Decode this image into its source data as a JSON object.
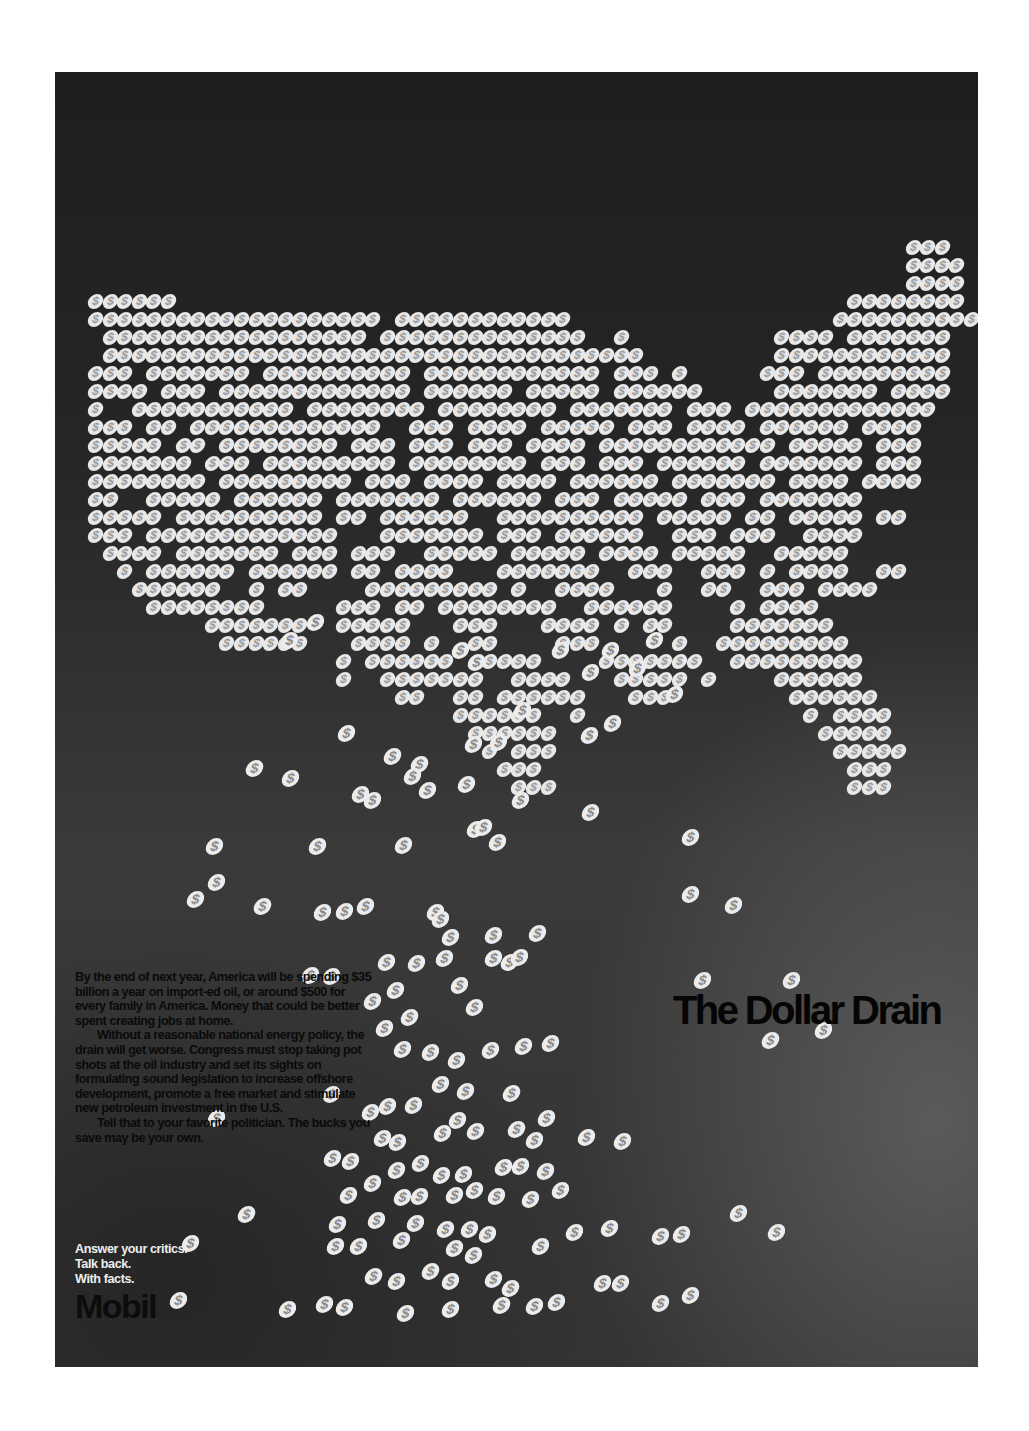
{
  "colors": {
    "page_bg": "#ffffff",
    "panel_bg": "#262626",
    "coin": "#e8e8e8",
    "body_text": "#0a0a0a",
    "tagline_text": "#eeeeee"
  },
  "coin_glyph": "$",
  "headline": "The Dollar Drain",
  "body_copy": {
    "paragraphs": [
      "By the end of next year, America will be spending $35 billion a year on import-ed oil, or around $500 for every family in America. Money that could be better spent creating jobs at home.",
      "Without a reasonable national energy policy, the drain will get worse. Congress must stop taking pot shots at the oil industry and set its sights on formulating sound legislation to increase offshore development, promote a free market and stimulate new petroleum investment in the U.S.",
      "Tell that to your favorite politician. The bucks you save may be your own."
    ]
  },
  "tagline": {
    "lines": [
      "Answer your critics.",
      "Talk back.",
      "With facts."
    ]
  },
  "logo": "Mobil",
  "map_grid": {
    "origin_x": 40,
    "origin_y": 175,
    "col_pitch": 14.6,
    "row_pitch": 18,
    "rows": [
      [
        [
          56,
          3
        ]
      ],
      [
        [
          56,
          4
        ]
      ],
      [
        [
          56,
          4
        ]
      ],
      [
        [
          0,
          6
        ],
        [
          52,
          8
        ]
      ],
      [
        [
          0,
          20
        ],
        [
          21,
          12
        ],
        [
          51,
          10
        ]
      ],
      [
        [
          1,
          18
        ],
        [
          20,
          14
        ],
        [
          36,
          1
        ],
        [
          47,
          4
        ],
        [
          52,
          4
        ],
        [
          53,
          6
        ]
      ],
      [
        [
          1,
          33
        ],
        [
          34,
          4
        ],
        [
          47,
          12
        ]
      ],
      [
        [
          0,
          3
        ],
        [
          4,
          7
        ],
        [
          12,
          10
        ],
        [
          23,
          12
        ],
        [
          36,
          3
        ],
        [
          40,
          1
        ],
        [
          46,
          3
        ],
        [
          50,
          9
        ]
      ],
      [
        [
          0,
          4
        ],
        [
          5,
          3
        ],
        [
          9,
          13
        ],
        [
          23,
          6
        ],
        [
          30,
          5
        ],
        [
          36,
          6
        ],
        [
          47,
          7
        ],
        [
          55,
          4
        ]
      ],
      [
        [
          0,
          1
        ],
        [
          3,
          11
        ],
        [
          15,
          8
        ],
        [
          24,
          8
        ],
        [
          33,
          7
        ],
        [
          41,
          3
        ],
        [
          45,
          13
        ]
      ],
      [
        [
          0,
          3
        ],
        [
          4,
          2
        ],
        [
          7,
          13
        ],
        [
          22,
          3
        ],
        [
          26,
          4
        ],
        [
          31,
          5
        ],
        [
          37,
          3
        ],
        [
          41,
          4
        ],
        [
          46,
          6
        ],
        [
          53,
          4
        ]
      ],
      [
        [
          0,
          5
        ],
        [
          6,
          2
        ],
        [
          9,
          8
        ],
        [
          18,
          3
        ],
        [
          22,
          3
        ],
        [
          26,
          3
        ],
        [
          30,
          4
        ],
        [
          35,
          12
        ],
        [
          48,
          5
        ],
        [
          54,
          3
        ]
      ],
      [
        [
          0,
          7
        ],
        [
          8,
          3
        ],
        [
          12,
          9
        ],
        [
          22,
          8
        ],
        [
          31,
          3
        ],
        [
          35,
          3
        ],
        [
          39,
          6
        ],
        [
          46,
          7
        ],
        [
          54,
          3
        ]
      ],
      [
        [
          0,
          8
        ],
        [
          9,
          9
        ],
        [
          19,
          3
        ],
        [
          23,
          4
        ],
        [
          28,
          4
        ],
        [
          33,
          6
        ],
        [
          40,
          7
        ],
        [
          48,
          4
        ],
        [
          53,
          4
        ]
      ],
      [
        [
          0,
          2
        ],
        [
          4,
          5
        ],
        [
          10,
          6
        ],
        [
          17,
          7
        ],
        [
          25,
          6
        ],
        [
          32,
          3
        ],
        [
          36,
          5
        ],
        [
          42,
          3
        ],
        [
          46,
          7
        ]
      ],
      [
        [
          0,
          5
        ],
        [
          6,
          10
        ],
        [
          17,
          2
        ],
        [
          20,
          6
        ],
        [
          28,
          10
        ],
        [
          39,
          5
        ],
        [
          45,
          2
        ],
        [
          48,
          5
        ],
        [
          54,
          2
        ]
      ],
      [
        [
          0,
          3
        ],
        [
          4,
          13
        ],
        [
          20,
          7
        ],
        [
          28,
          3
        ],
        [
          32,
          6
        ],
        [
          40,
          3
        ],
        [
          44,
          3
        ],
        [
          49,
          4
        ]
      ],
      [
        [
          1,
          4
        ],
        [
          6,
          7
        ],
        [
          14,
          3
        ],
        [
          18,
          3
        ],
        [
          23,
          5
        ],
        [
          29,
          5
        ],
        [
          35,
          4
        ],
        [
          40,
          5
        ],
        [
          47,
          5
        ]
      ],
      [
        [
          2,
          1
        ],
        [
          4,
          6
        ],
        [
          11,
          6
        ],
        [
          18,
          2
        ],
        [
          21,
          4
        ],
        [
          28,
          7
        ],
        [
          37,
          3
        ],
        [
          42,
          3
        ],
        [
          46,
          1
        ],
        [
          48,
          4
        ],
        [
          54,
          2
        ]
      ],
      [
        [
          3,
          6
        ],
        [
          11,
          1
        ],
        [
          13,
          2
        ],
        [
          19,
          9
        ],
        [
          29,
          1
        ],
        [
          32,
          4
        ],
        [
          39,
          1
        ],
        [
          42,
          2
        ],
        [
          46,
          3
        ],
        [
          50,
          4
        ]
      ],
      [
        [
          4,
          7
        ],
        [
          11,
          1
        ],
        [
          17,
          3
        ],
        [
          21,
          2
        ],
        [
          24,
          8
        ],
        [
          34,
          6
        ],
        [
          44,
          1
        ],
        [
          46,
          4
        ]
      ],
      [
        [
          8,
          7
        ],
        [
          17,
          5
        ],
        [
          25,
          3
        ],
        [
          31,
          4
        ],
        [
          36,
          1
        ],
        [
          38,
          2
        ],
        [
          44,
          7
        ]
      ],
      [
        [
          9,
          6
        ],
        [
          18,
          4
        ],
        [
          23,
          1
        ],
        [
          26,
          2
        ],
        [
          32,
          3
        ],
        [
          40,
          1
        ],
        [
          43,
          9
        ]
      ],
      [
        [
          17,
          1
        ],
        [
          19,
          6
        ],
        [
          27,
          4
        ],
        [
          35,
          7
        ],
        [
          44,
          9
        ]
      ],
      [
        [
          17,
          1
        ],
        [
          20,
          7
        ],
        [
          29,
          4
        ],
        [
          36,
          5
        ],
        [
          42,
          1
        ],
        [
          47,
          6
        ]
      ],
      [
        [
          21,
          2
        ],
        [
          25,
          2
        ],
        [
          28,
          6
        ],
        [
          37,
          3
        ],
        [
          48,
          6
        ]
      ],
      [
        [
          25,
          6
        ],
        [
          33,
          1
        ],
        [
          49,
          1
        ],
        [
          51,
          4
        ]
      ],
      [
        [
          26,
          6
        ],
        [
          50,
          5
        ]
      ],
      [
        [
          27,
          1
        ],
        [
          29,
          3
        ],
        [
          51,
          5
        ]
      ],
      [
        [
          28,
          3
        ],
        [
          52,
          3
        ]
      ],
      [
        [
          29,
          3
        ],
        [
          52,
          3
        ]
      ]
    ]
  },
  "falling_coins": [
    [
      289,
      640
    ],
    [
      315,
      622
    ],
    [
      460,
      650
    ],
    [
      476,
      662
    ],
    [
      560,
      650
    ],
    [
      590,
      672
    ],
    [
      610,
      650
    ],
    [
      637,
      668
    ],
    [
      654,
      640
    ],
    [
      346,
      733
    ],
    [
      392,
      756
    ],
    [
      419,
      764
    ],
    [
      473,
      744
    ],
    [
      498,
      742
    ],
    [
      522,
      710
    ],
    [
      589,
      735
    ],
    [
      612,
      723
    ],
    [
      674,
      694
    ],
    [
      254,
      768
    ],
    [
      290,
      778
    ],
    [
      360,
      794
    ],
    [
      372,
      800
    ],
    [
      412,
      776
    ],
    [
      427,
      790
    ],
    [
      466,
      784
    ],
    [
      520,
      800
    ],
    [
      214,
      846
    ],
    [
      317,
      846
    ],
    [
      403,
      845
    ],
    [
      475,
      829
    ],
    [
      483,
      827
    ],
    [
      497,
      842
    ],
    [
      590,
      812
    ],
    [
      690,
      837
    ],
    [
      195,
      899
    ],
    [
      262,
      906
    ],
    [
      322,
      912
    ],
    [
      344,
      911
    ],
    [
      365,
      906
    ],
    [
      435,
      912
    ],
    [
      450,
      937
    ],
    [
      493,
      935
    ],
    [
      537,
      933
    ],
    [
      440,
      919
    ],
    [
      386,
      962
    ],
    [
      416,
      963
    ],
    [
      444,
      958
    ],
    [
      493,
      958
    ],
    [
      509,
      962
    ],
    [
      519,
      957
    ],
    [
      690,
      894
    ],
    [
      733,
      905
    ],
    [
      310,
      975
    ],
    [
      331,
      976
    ],
    [
      372,
      1001
    ],
    [
      395,
      990
    ],
    [
      409,
      1017
    ],
    [
      459,
      985
    ],
    [
      474,
      1007
    ],
    [
      384,
      1028
    ],
    [
      402,
      1049
    ],
    [
      430,
      1052
    ],
    [
      456,
      1060
    ],
    [
      490,
      1050
    ],
    [
      523,
      1046
    ],
    [
      550,
      1043
    ],
    [
      216,
      1118
    ],
    [
      331,
      1094
    ],
    [
      370,
      1112
    ],
    [
      387,
      1106
    ],
    [
      413,
      1105
    ],
    [
      440,
      1084
    ],
    [
      465,
      1091
    ],
    [
      511,
      1093
    ],
    [
      546,
      1118
    ],
    [
      382,
      1138
    ],
    [
      397,
      1142
    ],
    [
      442,
      1133
    ],
    [
      457,
      1120
    ],
    [
      475,
      1131
    ],
    [
      516,
      1129
    ],
    [
      534,
      1140
    ],
    [
      586,
      1137
    ],
    [
      622,
      1141
    ],
    [
      332,
      1158
    ],
    [
      350,
      1161
    ],
    [
      396,
      1170
    ],
    [
      420,
      1163
    ],
    [
      441,
      1175
    ],
    [
      463,
      1174
    ],
    [
      503,
      1167
    ],
    [
      520,
      1166
    ],
    [
      545,
      1171
    ],
    [
      348,
      1195
    ],
    [
      372,
      1183
    ],
    [
      402,
      1197
    ],
    [
      419,
      1196
    ],
    [
      454,
      1195
    ],
    [
      474,
      1190
    ],
    [
      496,
      1196
    ],
    [
      530,
      1199
    ],
    [
      560,
      1190
    ],
    [
      246,
      1214
    ],
    [
      337,
      1224
    ],
    [
      376,
      1220
    ],
    [
      415,
      1223
    ],
    [
      445,
      1229
    ],
    [
      469,
      1229
    ],
    [
      487,
      1234
    ],
    [
      574,
      1232
    ],
    [
      609,
      1228
    ],
    [
      738,
      1213
    ],
    [
      776,
      1232
    ],
    [
      190,
      1243
    ],
    [
      335,
      1246
    ],
    [
      358,
      1246
    ],
    [
      401,
      1240
    ],
    [
      454,
      1248
    ],
    [
      473,
      1255
    ],
    [
      540,
      1246
    ],
    [
      660,
      1236
    ],
    [
      681,
      1234
    ],
    [
      373,
      1276
    ],
    [
      396,
      1281
    ],
    [
      430,
      1271
    ],
    [
      450,
      1281
    ],
    [
      493,
      1279
    ],
    [
      510,
      1288
    ],
    [
      602,
      1283
    ],
    [
      620,
      1283
    ],
    [
      690,
      1295
    ],
    [
      178,
      1300
    ],
    [
      287,
      1309
    ],
    [
      324,
      1304
    ],
    [
      344,
      1307
    ],
    [
      405,
      1313
    ],
    [
      450,
      1309
    ],
    [
      501,
      1305
    ],
    [
      534,
      1306
    ],
    [
      556,
      1302
    ],
    [
      660,
      1303
    ]
  ],
  "misc_coins": [
    [
      216,
      882
    ],
    [
      702,
      980
    ],
    [
      791,
      980
    ],
    [
      823,
      1030
    ],
    [
      770,
      1040
    ]
  ]
}
